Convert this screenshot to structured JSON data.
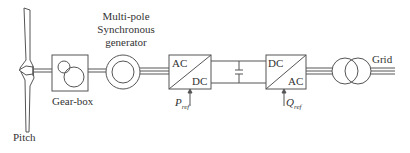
{
  "diagram": {
    "components": {
      "blade": {
        "label": "Pitch"
      },
      "gearbox": {
        "label": "Gear-box"
      },
      "generator": {
        "label_line1": "Multi-pole",
        "label_line2": "Synchronous",
        "label_line3": "generator"
      },
      "rectifier": {
        "top_label": "AC",
        "bottom_label": "DC",
        "control_input": "P",
        "control_sub": "ref"
      },
      "dc_link": {
        "element": "capacitor"
      },
      "inverter": {
        "top_label": "DC",
        "bottom_label": "AC",
        "control_input": "Q",
        "control_sub": "ref"
      },
      "transformer": {
        "element": "two-winding transformer"
      },
      "grid": {
        "label": "Grid"
      }
    },
    "colors": {
      "stroke": "#555555",
      "text": "#333333",
      "background": "#ffffff"
    }
  }
}
